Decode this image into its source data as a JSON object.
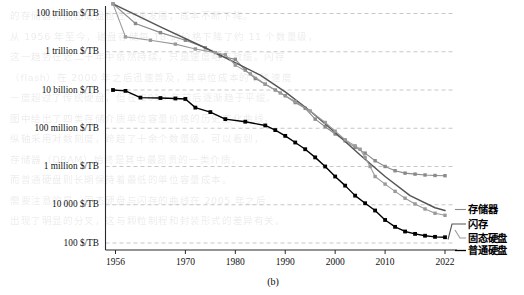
{
  "figure": {
    "caption": "(b)",
    "bleed_text": "的存储器和固态硬盘也在飞速发展，成本不断下降。\n从 1956 年至今，磁盘存储每 TB 的价格下降了约 11 个数量级，\n这一趋势在近二十年中依然持续，只是速度略有放缓。闪存\n（flash）在 2000 年之后迅速普及，其单位成本的下降速度\n一度超过了传统硬盘，但在 2010 年前后逐渐趋于平缓。\n图中给出了四类存储介质单位容量价格的历史变化曲线，\n纵轴采用对数刻度，跨越了十余个数量级。可以看到，\n存储器（DRAM）始终是其中最昂贵的一类介质，\n而普通硬盘则长期保持着最低的单位容量成本。\n需要注意的是，固态硬盘与闪存的曲线在 2005 年之后\n出现了明显的分叉，这与颗粒制程和封装形式的差异有关。"
  },
  "axes": {
    "y_ticks": [
      "100 trillion $/TB",
      "1 trillion $/TB",
      "10 billion $/TB",
      "100 million $/TB",
      "1 million $/TB",
      "10 000 $/TB",
      "100 $/TB"
    ],
    "x_ticks": [
      "1956",
      "1970",
      "1980",
      "1990",
      "2000",
      "2010",
      "2022"
    ]
  },
  "legend": {
    "items": [
      {
        "label": "存储器",
        "color": "#8a8a8a"
      },
      {
        "label": "闪存",
        "color": "#555555"
      },
      {
        "label": "固态硬盘",
        "color": "#9a9a9a"
      },
      {
        "label": "普通硬盘",
        "color": "#000000"
      }
    ]
  },
  "chart_data": {
    "type": "line",
    "title": "",
    "xlabel": "",
    "ylabel": "",
    "yscale": "log",
    "ylim_label": [
      "100 $/TB",
      "100 trillion $/TB"
    ],
    "y_tick_values": [
      100000000000000.0,
      1000000000000.0,
      10000000000.0,
      100000000.0,
      1000000.0,
      10000.0,
      100.0
    ],
    "y_tick_labels": [
      "100 trillion $/TB",
      "1 trillion $/TB",
      "10 billion $/TB",
      "100 million $/TB",
      "1 million $/TB",
      "10 000 $/TB",
      "100 $/TB"
    ],
    "x_tick_values": [
      1956,
      1970,
      1980,
      1990,
      2000,
      2010,
      2022
    ],
    "x_tick_labels": [
      "1956",
      "1970",
      "1980",
      "1990",
      "2000",
      "2010",
      "2022"
    ],
    "xlim": [
      1954,
      2024
    ],
    "grid": "horizontal-dashed",
    "legend_position": "right-outside",
    "series": [
      {
        "name": "存储器",
        "color": "#8a8a8a",
        "marker": "square",
        "points": [
          [
            1955.5,
            320000000000000.0
          ],
          [
            1960,
            30000000000000.0
          ],
          [
            1965,
            10000000000000.0
          ],
          [
            1970,
            4000000000000.0
          ],
          [
            1974,
            1600000000000.0
          ],
          [
            1977,
            600000000000.0
          ],
          [
            1980,
            400000000000.0
          ],
          [
            1982,
            110000000000.0
          ],
          [
            1984,
            40000000000.0
          ],
          [
            1986,
            20000000000.0
          ],
          [
            1988,
            10000000000.0
          ],
          [
            1990,
            5000000000.0
          ],
          [
            1992,
            2200000000.0
          ],
          [
            1994,
            1100000000.0
          ],
          [
            1996,
            300000000.0
          ],
          [
            1998,
            120000000.0
          ],
          [
            2000,
            50000000.0
          ],
          [
            2002,
            22000000.0
          ],
          [
            2004,
            10000000.0
          ],
          [
            2006,
            5000000.0
          ],
          [
            2008,
            2000000.0
          ],
          [
            2010,
            1000000.0
          ],
          [
            2012,
            600000.0
          ],
          [
            2014,
            450000.0
          ],
          [
            2016,
            400000.0
          ],
          [
            2018,
            360000.0
          ],
          [
            2020,
            340000.0
          ],
          [
            2022,
            330000.0
          ]
        ]
      },
      {
        "name": "闪存",
        "color": "#555555",
        "marker": "none",
        "points": [
          [
            1955.5,
            320000000000000.0
          ],
          [
            1965,
            20000000000000.0
          ],
          [
            1975,
            1200000000000.0
          ],
          [
            1985,
            60000000000.0
          ],
          [
            1990,
            8000000000.0
          ],
          [
            1995,
            800000000.0
          ],
          [
            2000,
            60000000.0
          ],
          [
            2005,
            4000000.0
          ],
          [
            2010,
            300000.0
          ],
          [
            2015,
            30000.0
          ],
          [
            2020,
            7000.0
          ],
          [
            2022,
            5000.0
          ]
        ]
      },
      {
        "name": "固态硬盘",
        "color": "#9a9a9a",
        "marker": "square",
        "points": [
          [
            1955.5,
            320000000000000.0
          ],
          [
            1958,
            6000000000000.0
          ],
          [
            1963,
            4000000000000.0
          ],
          [
            1968,
            2500000000000.0
          ],
          [
            1972,
            1400000000000.0
          ],
          [
            1976,
            900000000000.0
          ],
          [
            1978,
            700000000000.0
          ],
          [
            1980,
            200000000000.0
          ],
          [
            1983,
            70000000000.0
          ],
          [
            1986,
            20000000000.0
          ],
          [
            1989,
            7000000000.0
          ],
          [
            1992,
            2500000000.0
          ],
          [
            1995,
            800000000.0
          ],
          [
            1998,
            200000000.0
          ],
          [
            2000,
            70000000.0
          ],
          [
            2002,
            25000000.0
          ],
          [
            2004,
            12000000.0
          ],
          [
            2005,
            8000000.0
          ],
          [
            2006,
            3000000.0
          ],
          [
            2007,
            1000000.0
          ],
          [
            2008,
            300000.0
          ],
          [
            2010,
            120000.0
          ],
          [
            2012,
            50000.0
          ],
          [
            2014,
            22000.0
          ],
          [
            2016,
            11000.0
          ],
          [
            2018,
            6000.0
          ],
          [
            2020,
            3600.0
          ],
          [
            2022,
            2800.0
          ]
        ]
      },
      {
        "name": "普通硬盘",
        "color": "#000000",
        "marker": "square",
        "points": [
          [
            1955.5,
            10000000000.0
          ],
          [
            1958,
            9000000000.0
          ],
          [
            1961,
            4000000000.0
          ],
          [
            1965,
            3800000000.0
          ],
          [
            1968,
            3600000000.0
          ],
          [
            1970,
            3400000000.0
          ],
          [
            1972,
            1200000000.0
          ],
          [
            1975,
            700000000.0
          ],
          [
            1978,
            300000000.0
          ],
          [
            1982,
            220000000.0
          ],
          [
            1986,
            140000000.0
          ],
          [
            1988,
            80000000.0
          ],
          [
            1990,
            40000000.0
          ],
          [
            1992,
            18000000.0
          ],
          [
            1994,
            8000000.0
          ],
          [
            1996,
            3000000.0
          ],
          [
            1998,
            1000000.0
          ],
          [
            2000,
            300000.0
          ],
          [
            2002,
            100000.0
          ],
          [
            2004,
            30000.0
          ],
          [
            2006,
            12000.0
          ],
          [
            2008,
            5000.0
          ],
          [
            2010,
            1600.0
          ],
          [
            2012,
            700.0
          ],
          [
            2014,
            400.0
          ],
          [
            2016,
            300.0
          ],
          [
            2018,
            240.0
          ],
          [
            2020,
            210.0
          ],
          [
            2022,
            200.0
          ]
        ]
      }
    ]
  }
}
